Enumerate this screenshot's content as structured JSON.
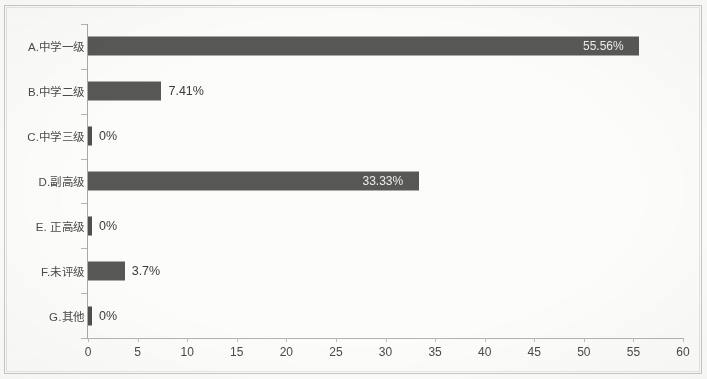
{
  "chart_data": {
    "type": "bar",
    "orientation": "horizontal",
    "title": "",
    "xlabel": "",
    "ylabel": "",
    "xlim": [
      0,
      60
    ],
    "xticks": [
      "0",
      "5",
      "10",
      "15",
      "20",
      "25",
      "30",
      "35",
      "40",
      "45",
      "50",
      "55",
      "60"
    ],
    "grid": false,
    "legend": false,
    "categories": [
      "A.中学一级",
      "B.中学二级",
      "C.中学三级",
      "D.副高级",
      "E. 正高级",
      "F.未评级",
      "G.其他"
    ],
    "values": [
      55.56,
      7.41,
      0,
      33.33,
      0,
      3.7,
      0
    ],
    "data_labels": [
      "55.56%",
      "7.41%",
      "0%",
      "33.33%",
      "0%",
      "3.7%",
      "0%"
    ],
    "bar_color": "#585856",
    "label_inside_color": "#efefed",
    "label_outside_color": "#3b3b39",
    "axis_color": "#b4b4b2"
  }
}
